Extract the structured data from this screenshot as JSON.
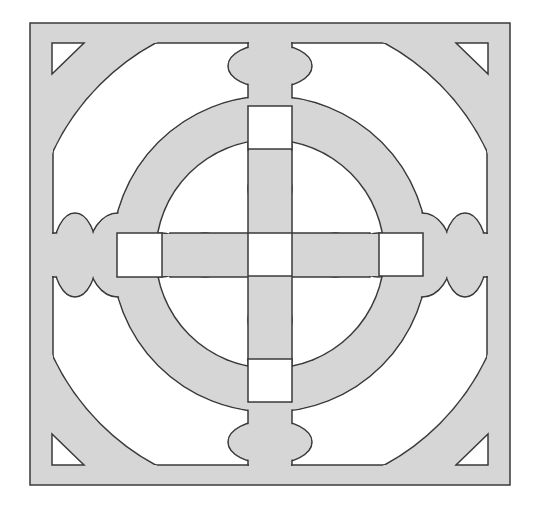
{
  "figure": {
    "colors": {
      "background": "#ffffff",
      "fill": "#d6d6d6",
      "cutout": "#ffffff",
      "stroke": "#3a3a3a"
    },
    "outer_frame": {
      "x": 30,
      "y": 23,
      "w": 480,
      "h": 462
    },
    "inner_frame": {
      "x": 53,
      "y": 43,
      "w": 434,
      "h": 422
    },
    "center": {
      "x": 270,
      "y": 254
    },
    "ring": {
      "outer_radius": 158,
      "inner_radius": 115
    },
    "corner_clip_radius": 240,
    "squares": [
      {
        "name": "top",
        "x": 248,
        "y": 106,
        "size": 44
      },
      {
        "name": "left",
        "x": 117,
        "y": 233,
        "size": 44
      },
      {
        "name": "center",
        "x": 248,
        "y": 233,
        "size": 44
      },
      {
        "name": "right",
        "x": 379,
        "y": 233,
        "size": 44
      },
      {
        "name": "bottom",
        "x": 248,
        "y": 359,
        "size": 44
      }
    ],
    "corner_triangles": [
      "top-left",
      "top-right",
      "bottom-left",
      "bottom-right"
    ]
  }
}
